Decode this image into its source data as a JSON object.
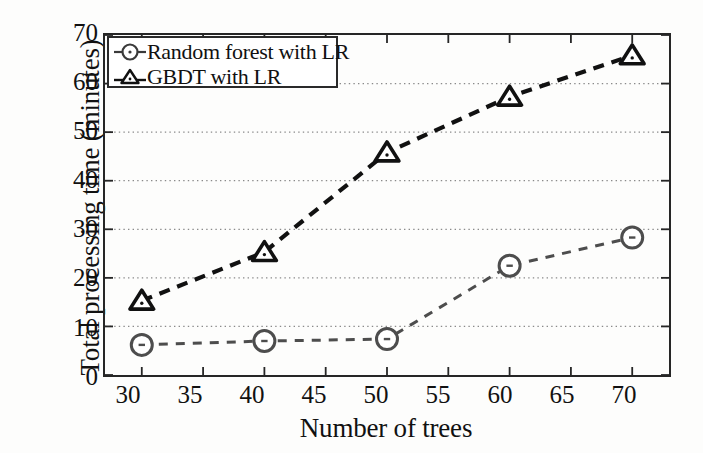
{
  "chart_data": {
    "type": "line",
    "title": "",
    "xlabel": "Number of trees",
    "ylabel": "Total processing time (minutes)",
    "x": [
      30,
      40,
      50,
      60,
      70
    ],
    "xlim": [
      27,
      73
    ],
    "ylim": [
      0,
      70
    ],
    "xticks": [
      30,
      35,
      40,
      45,
      50,
      55,
      60,
      65,
      70
    ],
    "xtick_labels": [
      "30",
      "35",
      "40",
      "45",
      "50",
      "55",
      "60",
      "65",
      "70"
    ],
    "yticks": [
      0,
      10,
      20,
      30,
      40,
      50,
      60,
      70
    ],
    "ytick_labels": [
      "0",
      "10",
      "20",
      "30",
      "40",
      "50",
      "60",
      "70"
    ],
    "grid": "horizontal-dotted",
    "legend_position": "upper-left",
    "line_style": "dashed",
    "series": [
      {
        "name": "Random forest with LR",
        "marker": "circle",
        "color": "#4d4d4d",
        "values": [
          6.2,
          7.0,
          7.4,
          22.5,
          28.3
        ]
      },
      {
        "name": "GBDT with LR",
        "marker": "triangle",
        "color": "#111111",
        "values": [
          15.3,
          25.3,
          45.8,
          57.3,
          65.8
        ]
      }
    ]
  },
  "legend": {
    "items": [
      {
        "label": "Random forest with LR",
        "marker": "circle-marker-icon"
      },
      {
        "label": "GBDT with LR",
        "marker": "triangle-marker-icon"
      }
    ]
  },
  "axes": {
    "x_title": "Number of trees",
    "y_title": "Total processing time (minutes)"
  }
}
